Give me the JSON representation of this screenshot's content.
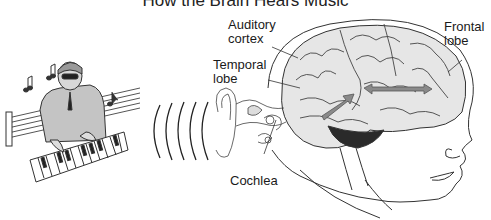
{
  "title": "How the Brain Hears Music",
  "labels": {
    "auditory_cortex_1": "Auditory",
    "auditory_cortex_2": "cortex",
    "temporal_lobe_1": "Temporal",
    "temporal_lobe_2": "lobe",
    "frontal_lobe_1": "Frontal",
    "frontal_lobe_2": "lobe",
    "cochlea": "Cochlea"
  },
  "colors": {
    "line": "#333333",
    "brain_fill": "#e6e6e6",
    "arrow": "#8a8a8a",
    "cerebellum": "#2a2a2a",
    "musician_fill": "#bdbdbd"
  }
}
